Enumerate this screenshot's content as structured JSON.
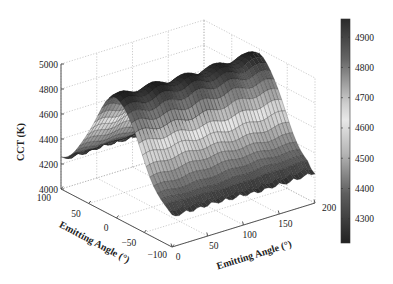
{
  "chart_data": {
    "type": "surface3d",
    "title": "",
    "zlabel": "CCT (K)",
    "xlabel": "Emitting Angle (°)",
    "ylabel": "Emitting Angle (°)",
    "x_axis": {
      "label": "Emitting Angle (°)",
      "range": [
        0,
        200
      ],
      "ticks": [
        0,
        50,
        100,
        150,
        200
      ]
    },
    "y_axis": {
      "label": "Emitting Angle (°)",
      "range": [
        -100,
        100
      ],
      "ticks": [
        100,
        50,
        0,
        -50,
        -100
      ]
    },
    "z_axis": {
      "label": "CCT (K)",
      "range": [
        4000,
        5000
      ],
      "ticks": [
        4000,
        4200,
        4400,
        4600,
        4800,
        5000
      ]
    },
    "colorbar": {
      "ticks": [
        4900,
        4800,
        4700,
        4600,
        4500,
        4400,
        4300
      ],
      "range": [
        4220,
        4960
      ],
      "colormap": "gray-diverging: dark at ends, light near 4650"
    },
    "grid": true,
    "surface_description": "Ridge along x (0–200°), peaking near y≈0 at ~4950 K with ripples along x; falls to ~4200 K at y=±100",
    "surface_samples": {
      "y": [
        -100,
        -75,
        -50,
        -25,
        0,
        25,
        50,
        75,
        100
      ],
      "cct_profile": [
        4230,
        4450,
        4700,
        4880,
        4950,
        4880,
        4700,
        4450,
        4220
      ]
    }
  }
}
